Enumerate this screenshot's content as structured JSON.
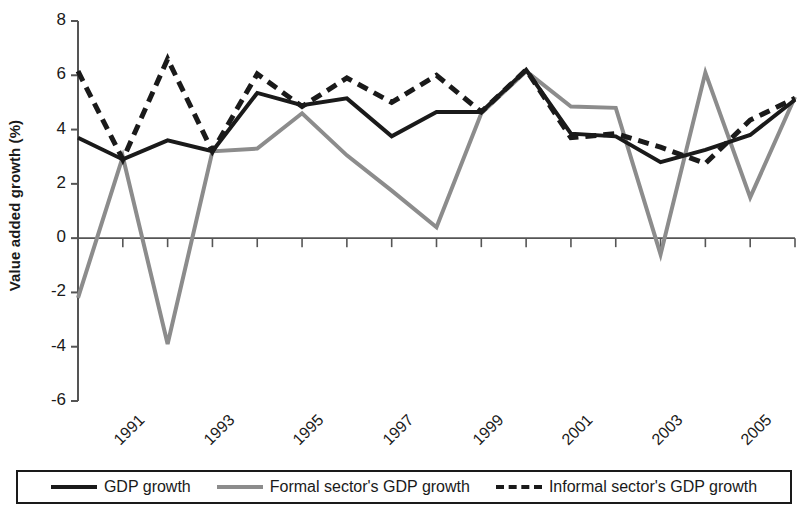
{
  "chart_data": {
    "type": "line",
    "title": "",
    "xlabel": "",
    "ylabel": "Value added growth (%)",
    "ylim": [
      -6,
      8
    ],
    "yticks": [
      8,
      6,
      4,
      2,
      0,
      -2,
      -4,
      -6
    ],
    "ytick_labels": [
      "8",
      "6",
      "4",
      "2",
      "0",
      "-2",
      "-4",
      "-6"
    ],
    "x": [
      1991,
      1992,
      1993,
      1994,
      1995,
      1996,
      1997,
      1998,
      1999,
      2000,
      2001,
      2002,
      2003,
      2004,
      2005,
      2006,
      2007
    ],
    "xtick_labels": [
      "1991",
      "1993",
      "1995",
      "1997",
      "1999",
      "2001",
      "2003",
      "2005",
      "2007"
    ],
    "xtick_years": [
      1991,
      1993,
      1995,
      1997,
      1999,
      2001,
      2003,
      2005,
      2007
    ],
    "grid": false,
    "legend_position": "bottom",
    "series": [
      {
        "name": "GDP growth",
        "color": "#1a1a1a",
        "style": "solid",
        "values": [
          3.7,
          2.9,
          3.6,
          3.2,
          5.35,
          4.9,
          5.15,
          3.75,
          4.65,
          4.65,
          6.2,
          3.85,
          3.75,
          2.8,
          3.25,
          3.8,
          5.1
        ]
      },
      {
        "name": "Formal sector's GDP growth",
        "color": "#8c8c8c",
        "style": "solid",
        "values": [
          -2.2,
          3.0,
          -3.9,
          3.2,
          3.3,
          4.6,
          3.05,
          1.75,
          0.4,
          4.6,
          6.15,
          4.85,
          4.8,
          -0.6,
          6.1,
          1.5,
          5.2
        ]
      },
      {
        "name": "Informal sector's GDP growth",
        "color": "#1a1a1a",
        "style": "dashed",
        "values": [
          6.15,
          2.9,
          6.6,
          3.2,
          6.05,
          4.85,
          5.9,
          5.0,
          6.0,
          4.65,
          6.2,
          3.7,
          3.85,
          3.35,
          2.75,
          4.35,
          5.15
        ]
      }
    ]
  },
  "legend": {
    "items": [
      {
        "label": "GDP growth",
        "swatch": "solid-black"
      },
      {
        "label": "Formal sector's GDP growth",
        "swatch": "solid-gray"
      },
      {
        "label": "Informal sector's GDP growth",
        "swatch": "dashed-black"
      }
    ]
  }
}
